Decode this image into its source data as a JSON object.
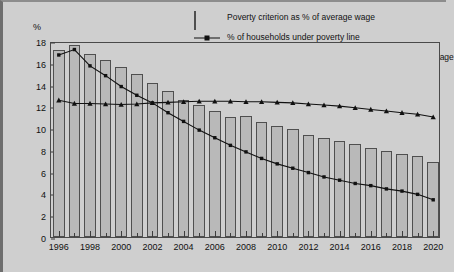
{
  "chart_data": {
    "type": "bar",
    "title": "",
    "xlabel": "",
    "ylabel": "%",
    "ylim": [
      0,
      18
    ],
    "ytick_step": 2,
    "yticks": [
      0,
      2,
      4,
      6,
      8,
      10,
      12,
      14,
      16,
      18
    ],
    "grid": false,
    "legend_position": "top-right-inside",
    "x": [
      1996,
      1997,
      1998,
      1999,
      2000,
      2001,
      2002,
      2003,
      2004,
      2005,
      2006,
      2007,
      2008,
      2009,
      2010,
      2011,
      2012,
      2013,
      2014,
      2015,
      2016,
      2017,
      2018,
      2019,
      2020
    ],
    "xtick_labels": [
      "1996",
      "1998",
      "2000",
      "2002",
      "2004",
      "2006",
      "2008",
      "2010",
      "2012",
      "2014",
      "2016",
      "2018",
      "2020"
    ],
    "categories": [
      "1996",
      "1997",
      "1998",
      "1999",
      "2000",
      "2001",
      "2002",
      "2003",
      "2004",
      "2005",
      "2006",
      "2007",
      "2008",
      "2009",
      "2010",
      "2011",
      "2012",
      "2013",
      "2014",
      "2015",
      "2016",
      "2017",
      "2018",
      "2019",
      "2020"
    ],
    "series": [
      {
        "name": "Poverty criterion as % of average wage",
        "type": "bar",
        "values": [
          17.2,
          17.6,
          16.8,
          16.3,
          15.6,
          15.0,
          14.1,
          13.4,
          12.6,
          12.1,
          11.6,
          11.0,
          11.1,
          10.6,
          10.2,
          9.9,
          9.4,
          9.1,
          8.8,
          8.5,
          8.2,
          7.9,
          7.6,
          7.4,
          6.9
        ]
      },
      {
        "name": "% of households under poverty line",
        "type": "line",
        "marker": "square",
        "values": [
          16.9,
          17.4,
          15.9,
          15.0,
          14.0,
          13.2,
          12.5,
          11.6,
          10.8,
          10.0,
          9.3,
          8.6,
          8.0,
          7.4,
          6.9,
          6.5,
          6.1,
          5.7,
          5.4,
          5.1,
          4.9,
          4.6,
          4.4,
          4.1,
          3.6
        ]
      },
      {
        "name": "% of households under poverty line of 15% of average wage",
        "type": "line",
        "marker": "triangle",
        "values": [
          12.75,
          12.45,
          12.45,
          12.4,
          12.35,
          12.4,
          12.5,
          12.55,
          12.6,
          12.65,
          12.65,
          12.65,
          12.6,
          12.6,
          12.55,
          12.5,
          12.4,
          12.3,
          12.2,
          12.05,
          11.9,
          11.75,
          11.6,
          11.45,
          11.2
        ]
      }
    ]
  },
  "legend": {
    "items": [
      {
        "label": "Poverty criterion as % of average wage",
        "key": "bar-swatch"
      },
      {
        "label": "% of households under poverty line",
        "key": "line-square"
      },
      {
        "label": "% of households under poverty line of 15% of average wage",
        "key": "line-triangle"
      }
    ]
  },
  "axis": {
    "y_unit_label": "%"
  }
}
